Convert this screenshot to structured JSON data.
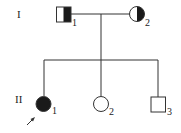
{
  "pedigree": {
    "generations": [
      {
        "label": "I",
        "members": [
          {
            "id": "1",
            "sex": "male",
            "status": "carrier (half-filled)"
          },
          {
            "id": "2",
            "sex": "female",
            "status": "carrier (half-filled)"
          }
        ]
      },
      {
        "label": "II",
        "members": [
          {
            "id": "1",
            "sex": "female",
            "status": "affected",
            "proband": true
          },
          {
            "id": "2",
            "sex": "female",
            "status": "unaffected"
          },
          {
            "id": "3",
            "sex": "male",
            "status": "unaffected"
          }
        ]
      }
    ]
  },
  "colors": {
    "line": "#333333",
    "fill": "#1a1a1a",
    "background": "#ffffff"
  }
}
